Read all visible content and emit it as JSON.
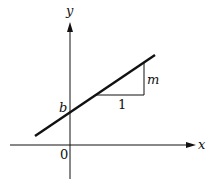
{
  "diagram": {
    "axes": {
      "x_label": "x",
      "y_label": "y",
      "origin_label": "0"
    },
    "line": {
      "intercept_label": "b",
      "run_label": "1",
      "rise_label": "m"
    },
    "colors": {
      "stroke": "#111111",
      "background": "#ffffff"
    }
  }
}
